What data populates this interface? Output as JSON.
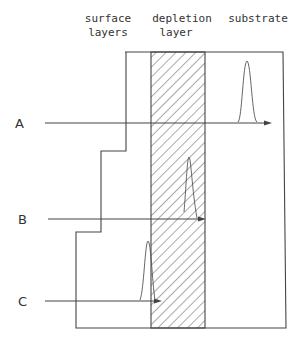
{
  "diagram": {
    "column_labels": [
      {
        "line1": "surface",
        "line2": "layers"
      },
      {
        "line1": "depletion",
        "line2": "layer"
      },
      {
        "line1": "substrate",
        "line2": ""
      }
    ],
    "arrows": [
      {
        "label": "A",
        "y": 123,
        "x_start": 45,
        "x_end": 271,
        "peak_x": 247,
        "peak_top": 61
      },
      {
        "label": "B",
        "y": 219,
        "x_start": 48,
        "x_end": 205,
        "peak_x": 189,
        "peak_top": 157
      },
      {
        "label": "C",
        "y": 301,
        "x_start": 45,
        "x_end": 160,
        "peak_x": 148,
        "peak_top": 241
      }
    ],
    "regions": {
      "depletion_x": [
        151,
        205
      ],
      "right_edge": 283,
      "top": 52,
      "bottom": 328
    },
    "colors": {
      "line": "#444444",
      "text": "#333333"
    }
  }
}
